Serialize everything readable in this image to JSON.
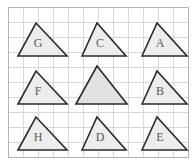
{
  "figure": {
    "width": 196,
    "height": 164,
    "background_color": "#ffffff"
  },
  "grid": {
    "name": "square-grid",
    "columns": 12,
    "rows": 10,
    "cell_size": 15,
    "origin_x": 8,
    "origin_y": 7,
    "line_color": "#d8d8d8",
    "line_width": 1,
    "border_color": "#b4b4b4",
    "border_width": 1,
    "visible": true
  },
  "style": {
    "triangle_fill": "#ededed",
    "triangle_fill_emphasis": "#e2e2e2",
    "triangle_stroke": "#2b2b2b",
    "triangle_stroke_width": 1.6,
    "label_color": "#5a5a5a",
    "label_font_size": 12
  },
  "triangles": [
    {
      "id": "triangle-g",
      "label": "G",
      "row": 1,
      "column": 1,
      "points": "18,56 36,23 67,56",
      "label_x": 38,
      "label_y": 44,
      "fill": "#ededed",
      "emphasis": false
    },
    {
      "id": "triangle-c",
      "label": "C",
      "row": 1,
      "column": 2,
      "points": "82,56 97,23 126,56",
      "label_x": 100,
      "label_y": 44,
      "fill": "#ededed",
      "emphasis": false
    },
    {
      "id": "triangle-a",
      "label": "A",
      "row": 1,
      "column": 3,
      "points": "142,56 157,23 187,56",
      "label_x": 160,
      "label_y": 44,
      "fill": "#ededed",
      "emphasis": false
    },
    {
      "id": "triangle-f",
      "label": "F",
      "row": 2,
      "column": 1,
      "points": "18,104 36,71 67,104",
      "label_x": 38,
      "label_y": 92,
      "fill": "#ededed",
      "emphasis": false
    },
    {
      "id": "triangle-center-unlabeled",
      "label": "",
      "row": 2,
      "column": 2,
      "points": "76,104 97,66 127,104",
      "label_x": 100,
      "label_y": 92,
      "fill": "#e2e2e2",
      "emphasis": true
    },
    {
      "id": "triangle-b",
      "label": "B",
      "row": 2,
      "column": 3,
      "points": "142,104 157,71 187,104",
      "label_x": 160,
      "label_y": 92,
      "fill": "#ededed",
      "emphasis": false
    },
    {
      "id": "triangle-h",
      "label": "H",
      "row": 3,
      "column": 1,
      "points": "18,150 36,117 67,150",
      "label_x": 38,
      "label_y": 138,
      "fill": "#ededed",
      "emphasis": false
    },
    {
      "id": "triangle-d",
      "label": "D",
      "row": 3,
      "column": 2,
      "points": "82,150 97,117 126,150",
      "label_x": 100,
      "label_y": 138,
      "fill": "#ededed",
      "emphasis": false
    },
    {
      "id": "triangle-e",
      "label": "E",
      "row": 3,
      "column": 3,
      "points": "142,150 157,117 187,150",
      "label_x": 160,
      "label_y": 138,
      "fill": "#ededed",
      "emphasis": false
    }
  ]
}
